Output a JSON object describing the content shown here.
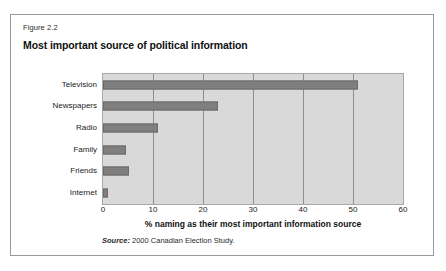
{
  "figure": {
    "number_label": "Figure 2.2",
    "title": "Most important source of political information",
    "source_keyword": "Source:",
    "source_text": " 2000 Canadian Election Study."
  },
  "colors": {
    "bar": "#7f7f7f",
    "plot_background": "#d9d9d9",
    "gridline": "#8e8e8e",
    "frame_border": "#9a9a9a",
    "page_background": "#ffffff",
    "text": "#1a1a1a"
  },
  "chart_data": {
    "type": "bar",
    "orientation": "horizontal",
    "title": "Most important source of political information",
    "subtitle": "Figure 2.2",
    "categories": [
      "Television",
      "Newspapers",
      "Radio",
      "Family",
      "Friends",
      "Internet"
    ],
    "values": [
      51,
      23,
      11,
      4.5,
      5.2,
      1
    ],
    "series": [
      {
        "name": "% naming as their most important information source",
        "values": [
          51,
          23,
          11,
          4.5,
          5.2,
          1
        ]
      }
    ],
    "xlabel": "% naming as their most important information source",
    "ylabel": "",
    "xlim": [
      0,
      60
    ],
    "xticks": [
      0,
      10,
      20,
      30,
      40,
      50,
      60
    ],
    "xtick_labels": [
      "0",
      "10",
      "20",
      "30",
      "40",
      "50",
      "60"
    ],
    "grid": "vertical",
    "legend": "none",
    "annotation": "Source: 2000 Canadian Election Study."
  }
}
